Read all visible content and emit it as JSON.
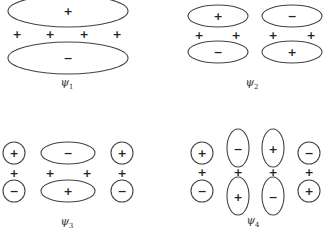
{
  "diagram": {
    "panels": [
      {
        "label": "ψ",
        "subscript": "1",
        "top_lobes": [
          "+"
        ],
        "bottom_lobes": [
          "−"
        ],
        "atom_signs": [
          "+",
          "+",
          "+",
          "+"
        ]
      },
      {
        "label": "ψ",
        "subscript": "2",
        "top_lobes": [
          "+",
          "−"
        ],
        "bottom_lobes": [
          "−",
          "+"
        ],
        "atom_signs": [
          "+",
          "+",
          "+",
          "+"
        ]
      },
      {
        "label": "ψ",
        "subscript": "3",
        "top_lobes": [
          "+",
          "−",
          "+"
        ],
        "bottom_lobes": [
          "−",
          "+",
          "−"
        ],
        "atom_signs": [
          "+",
          "+",
          "+",
          "+"
        ]
      },
      {
        "label": "ψ",
        "subscript": "4",
        "top_lobes": [
          "+",
          "−",
          "+",
          "−"
        ],
        "bottom_lobes": [
          "−",
          "+",
          "−",
          "+"
        ],
        "atom_signs": [
          "+",
          "+",
          "+",
          "+"
        ]
      }
    ]
  }
}
